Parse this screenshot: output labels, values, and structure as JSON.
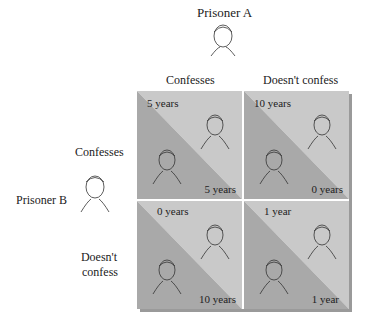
{
  "title_a": "Prisoner A",
  "title_b": "Prisoner B",
  "columns": [
    "Confesses",
    "Doesn't confess"
  ],
  "rows": [
    "Confesses",
    "Doesn't\nconfess"
  ],
  "row_labels": {
    "confesses": "Confesses",
    "doesnt_line1": "Doesn't",
    "doesnt_line2": "confess"
  },
  "cells": [
    {
      "a": "5 years",
      "b": "5 years"
    },
    {
      "a": "10 years",
      "b": "0 years"
    },
    {
      "a": "0 years",
      "b": "10 years"
    },
    {
      "a": "1 year",
      "b": "1 year"
    }
  ],
  "colors": {
    "light": "#c9c9c9",
    "dark": "#a9a9a9",
    "shadow": "#9a9a9a"
  }
}
